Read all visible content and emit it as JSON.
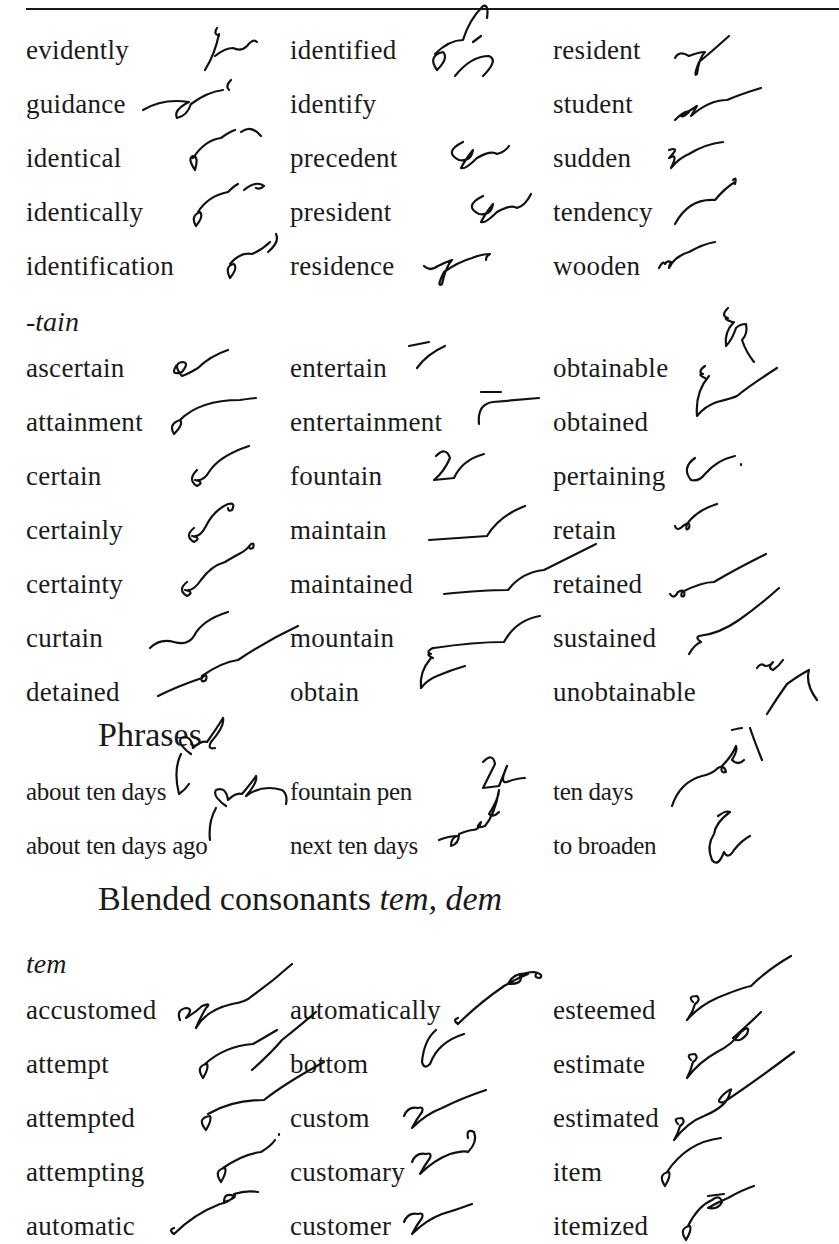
{
  "page": {
    "header_left_fragment": "Lesson 5",
    "header_right_fragment": "55"
  },
  "group1": {
    "rows": [
      [
        "evidently",
        "identified",
        "resident"
      ],
      [
        "guidance",
        "identify",
        "student"
      ],
      [
        "identical",
        "precedent",
        "sudden"
      ],
      [
        "identically",
        "president",
        "tendency"
      ],
      [
        "identification",
        "residence",
        "wooden"
      ]
    ]
  },
  "tain": {
    "label": "-tain",
    "rows": [
      [
        "ascertain",
        "entertain",
        "obtainable"
      ],
      [
        "attainment",
        "entertainment",
        "obtained"
      ],
      [
        "certain",
        "fountain",
        "pertaining"
      ],
      [
        "certainly",
        "maintain",
        "retain"
      ],
      [
        "certainty",
        "maintained",
        "retained"
      ],
      [
        "curtain",
        "mountain",
        "sustained"
      ],
      [
        "detained",
        "obtain",
        "unobtainable"
      ]
    ]
  },
  "phrases": {
    "heading": "Phrases",
    "rows": [
      [
        "about ten days",
        "fountain pen",
        "ten days"
      ],
      [
        "about ten days ago",
        "next ten days",
        "to broaden"
      ]
    ]
  },
  "blended": {
    "heading_plain": "Blended consonants ",
    "heading_italic": "tem, dem"
  },
  "tem": {
    "label": "tem",
    "rows": [
      [
        "accustomed",
        "automatically",
        "esteemed"
      ],
      [
        "attempt",
        "bottom",
        "estimate"
      ],
      [
        "attempted",
        "custom",
        "estimated"
      ],
      [
        "attempting",
        "customary",
        "item"
      ],
      [
        "automatic",
        "customer",
        "itemized"
      ]
    ]
  }
}
